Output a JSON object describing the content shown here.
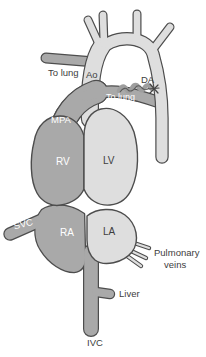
{
  "diagram": {
    "labels": {
      "to_lung_left": "To lung",
      "ao": "Ao",
      "da": "DA",
      "to_lung_right": "To lung",
      "mpa": "MPA",
      "rv": "RV",
      "lv": "LV",
      "svc": "SVC",
      "ra": "RA",
      "la": "LA",
      "pulmonary_veins_line1": "Pulmonary",
      "pulmonary_veins_line2": "veins",
      "liver": "Liver",
      "ivc": "IVC"
    },
    "colors": {
      "deoxygenated_fill": "#a9a9a9",
      "oxygenated_fill": "#dedede",
      "outline": "#4d4d4d",
      "label_dark": "#3d3d3d",
      "label_light": "#ffffff",
      "background": "#ffffff"
    }
  }
}
